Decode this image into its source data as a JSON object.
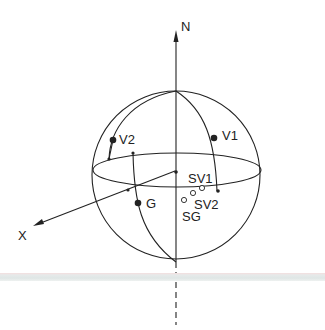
{
  "diagram": {
    "type": "celestial-sphere",
    "labels": {
      "north": "N",
      "x_axis": "X",
      "v1": "V1",
      "v2": "V2",
      "g": "G",
      "sv1": "SV1",
      "sv2": "SV2",
      "sg": "SG"
    },
    "colors": {
      "line": "#222222",
      "background": "#ffffff",
      "band": "#e2e8e7"
    }
  }
}
